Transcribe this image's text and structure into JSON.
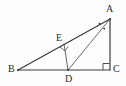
{
  "figure": {
    "kind": "geometry-diagram",
    "width": 126,
    "height": 86,
    "background_color": "#fefefe",
    "stroke_color": "#3a3a3a",
    "label_color": "#2b2b2b"
  },
  "points": {
    "A": {
      "label": "A",
      "x": 110,
      "y": 19
    },
    "B": {
      "label": "B",
      "x": 18,
      "y": 70
    },
    "C": {
      "label": "C",
      "x": 110,
      "y": 70
    },
    "D": {
      "label": "D",
      "x": 68,
      "y": 70
    },
    "E": {
      "label": "E",
      "x": 64,
      "y": 44
    }
  },
  "segments": [
    {
      "name": "BA",
      "from": "B",
      "to": "A"
    },
    {
      "name": "BC",
      "from": "B",
      "to": "C"
    },
    {
      "name": "AC",
      "from": "A",
      "to": "C"
    },
    {
      "name": "AD",
      "from": "A",
      "to": "D"
    },
    {
      "name": "DE",
      "from": "D",
      "to": "E"
    }
  ],
  "markers": {
    "right_angle_at_C": {
      "name": "right-angle-C",
      "vertex": "C",
      "size": 7
    },
    "right_angle_at_E": {
      "name": "right-angle-E",
      "vertex": "E",
      "size": 6
    },
    "angle_dots_at_A": {
      "name": "equal-angle-dots-A",
      "count": 2
    }
  }
}
